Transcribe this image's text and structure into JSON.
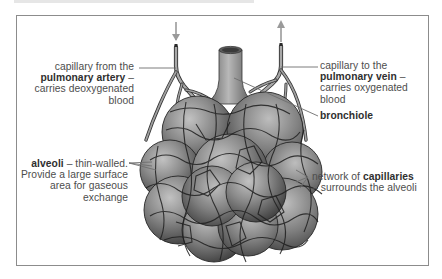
{
  "diagram": {
    "labels": {
      "artery": {
        "line1": "capillary from the",
        "bold": "pulmonary artery",
        "line2_suffix": " –",
        "line3": "carries deoxygenated",
        "line4": "blood"
      },
      "vein": {
        "line1": "capillary to the",
        "bold": "pulmonary vein",
        "line2_suffix": " –",
        "line3": "carries oxygenated",
        "line4": "blood"
      },
      "bronchiole": {
        "bold": "bronchiole"
      },
      "alveoli": {
        "bold": "alveoli",
        "line1_suffix": " – thin-walled.",
        "line2": "Provide a large surface",
        "line3": "area for gaseous",
        "line4": "exchange"
      },
      "capillaries": {
        "prefix": "network of ",
        "bold": "capillaries",
        "line2": "– surrounds the alveoli"
      }
    },
    "arrows": {
      "artery_flow": "down-arrow",
      "vein_flow": "up-arrow"
    },
    "colors": {
      "frame_border": "#8c8c8c",
      "label_text": "#4d4d4d",
      "leader_line": "#6e6e6e",
      "arrow": "#9a9a9a",
      "alveolus_dark": "#3c3c3c",
      "alveolus_light": "#b4b4b4",
      "capillary_stroke": "#2a2a2a"
    }
  }
}
